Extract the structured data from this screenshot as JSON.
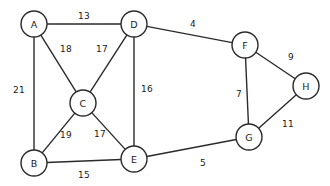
{
  "figure": {
    "kind": "undirected-weighted-graph",
    "width": 330,
    "height": 186,
    "background_color": "#ffffff",
    "stroke_color": "#2b2b2b",
    "text_color": "#1a1a1a",
    "node_radius": 13
  },
  "chart_data": {
    "type": "diagram",
    "title": "",
    "xlabel": "",
    "ylabel": "",
    "graph_kind": "undirected weighted graph",
    "node_count": 8,
    "edge_count": 13,
    "nodes": [
      {
        "id": "A",
        "label": "A",
        "x": 34,
        "y": 24
      },
      {
        "id": "D",
        "label": "D",
        "x": 134,
        "y": 24
      },
      {
        "id": "F",
        "label": "F",
        "x": 245,
        "y": 45
      },
      {
        "id": "H",
        "label": "H",
        "x": 306,
        "y": 86
      },
      {
        "id": "C",
        "label": "C",
        "x": 83,
        "y": 103
      },
      {
        "id": "G",
        "label": "G",
        "x": 249,
        "y": 137
      },
      {
        "id": "B",
        "label": "B",
        "x": 34,
        "y": 163
      },
      {
        "id": "E",
        "label": "E",
        "x": 134,
        "y": 159
      }
    ],
    "edges": [
      {
        "source": "A",
        "target": "D",
        "weight": 13,
        "label": "13",
        "label_x": 84,
        "label_y": 16
      },
      {
        "source": "A",
        "target": "C",
        "weight": 18,
        "label": "18",
        "label_x": 66,
        "label_y": 49
      },
      {
        "source": "A",
        "target": "B",
        "weight": 21,
        "label": "21",
        "label_x": 19,
        "label_y": 90
      },
      {
        "source": "D",
        "target": "C",
        "weight": 17,
        "label": "17",
        "label_x": 102,
        "label_y": 49
      },
      {
        "source": "D",
        "target": "E",
        "weight": 16,
        "label": "16",
        "label_x": 147,
        "label_y": 89
      },
      {
        "source": "D",
        "target": "F",
        "weight": 4,
        "label": "4",
        "label_x": 193,
        "label_y": 24
      },
      {
        "source": "C",
        "target": "B",
        "weight": 19,
        "label": "19",
        "label_x": 66,
        "label_y": 135
      },
      {
        "source": "C",
        "target": "E",
        "weight": 17,
        "label": "17",
        "label_x": 100,
        "label_y": 134
      },
      {
        "source": "B",
        "target": "E",
        "weight": 15,
        "label": "15",
        "label_x": 84,
        "label_y": 175
      },
      {
        "source": "E",
        "target": "G",
        "weight": 5,
        "label": "5",
        "label_x": 203,
        "label_y": 163
      },
      {
        "source": "F",
        "target": "G",
        "weight": 7,
        "label": "7",
        "label_x": 239,
        "label_y": 94
      },
      {
        "source": "F",
        "target": "H",
        "weight": 9,
        "label": "9",
        "label_x": 291,
        "label_y": 57
      },
      {
        "source": "G",
        "target": "H",
        "weight": 11,
        "label": "11",
        "label_x": 288,
        "label_y": 124
      }
    ],
    "node_labels": [
      "A",
      "B",
      "C",
      "D",
      "E",
      "F",
      "G",
      "H"
    ],
    "weights": [
      13,
      18,
      21,
      17,
      16,
      4,
      19,
      17,
      15,
      5,
      7,
      9,
      11
    ],
    "grid": false,
    "legend": "none"
  }
}
